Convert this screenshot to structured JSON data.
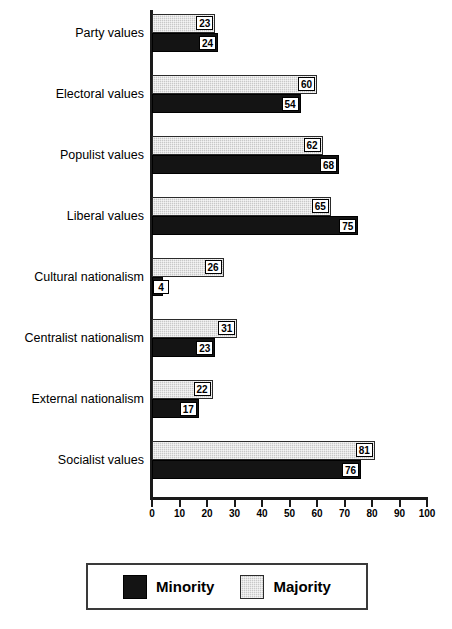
{
  "chart_data": {
    "type": "bar",
    "orientation": "horizontal",
    "title": "",
    "subtitle": "",
    "xlabel": "",
    "ylabel": "",
    "xlim": [
      0,
      100
    ],
    "xticks": [
      0,
      10,
      20,
      30,
      40,
      50,
      60,
      70,
      80,
      90,
      100
    ],
    "tick_labels": [
      "0",
      "10",
      "20",
      "30",
      "40",
      "50",
      "60",
      "70",
      "80",
      "90",
      "100"
    ],
    "grid": false,
    "legend_position": "bottom",
    "data_labels_shown": true,
    "categories": [
      "Party values",
      "Electoral values",
      "Populist values",
      "Liberal values",
      "Cultural nationalism",
      "Centralist nationalism",
      "External nationalism",
      "Socialist values"
    ],
    "series": [
      {
        "name": "Majority",
        "color": "#c8c8c8",
        "values": [
          23,
          60,
          62,
          65,
          26,
          31,
          22,
          81
        ]
      },
      {
        "name": "Minority",
        "color": "#141414",
        "values": [
          24,
          54,
          68,
          75,
          4,
          23,
          17,
          76
        ]
      }
    ]
  },
  "legend": {
    "entries": [
      {
        "label": "Minority",
        "swatch": "minority"
      },
      {
        "label": "Majority",
        "swatch": "majority"
      }
    ]
  }
}
